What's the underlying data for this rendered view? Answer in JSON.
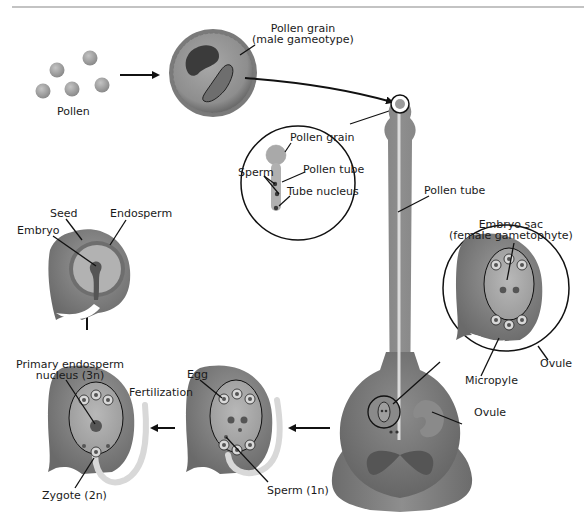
{
  "diagram": {
    "colors": {
      "background": "#ffffff",
      "ink": "#111111",
      "tissue_dark": "#6f6f6f",
      "tissue_mid": "#8c8c8c",
      "tissue_light": "#b4b4b4",
      "tube_light": "#e2e2e2",
      "nucleus": "#4a4a4a",
      "top_rule": "#888888"
    },
    "labels": {
      "pollen": "Pollen",
      "pollen_grain_line1": "Pollen grain",
      "pollen_grain_line2": "(male gameotype)",
      "inset_pollen_grain": "Pollen grain",
      "inset_sperm": "Sperm",
      "inset_pollen_tube": "Pollen tube",
      "inset_tube_nucleus": "Tube nucleus",
      "pollen_tube": "Pollen tube",
      "embryo_sac_line1": "Embryo sac",
      "embryo_sac_line2": "(female gametophyte)",
      "ovule_inset": "Ovule",
      "micropyle": "Micropyle",
      "ovule_pistil": "Ovule",
      "egg": "Egg",
      "sperm_1n": "Sperm (1n)",
      "fertilization": "Fertilization",
      "primary_endosperm_line1": "Primary endosperm",
      "primary_endosperm_line2": "nucleus (3n)",
      "zygote": "Zygote (2n)",
      "seed": "Seed",
      "embryo": "Embryo",
      "endosperm": "Endosperm"
    },
    "stages": [
      {
        "id": "pollen",
        "label": "Pollen"
      },
      {
        "id": "pollen-grain",
        "label": "Pollen grain (male gameotype)"
      },
      {
        "id": "germination-on-stigma",
        "label": "Pollen tube"
      },
      {
        "id": "ovule-embryo-sac",
        "label": "Embryo sac (female gametophyte)"
      },
      {
        "id": "sperm-reaches-egg",
        "label": "Sperm (1n)"
      },
      {
        "id": "double-fertilization",
        "label": "Fertilization"
      },
      {
        "id": "seed",
        "label": "Seed"
      }
    ]
  }
}
